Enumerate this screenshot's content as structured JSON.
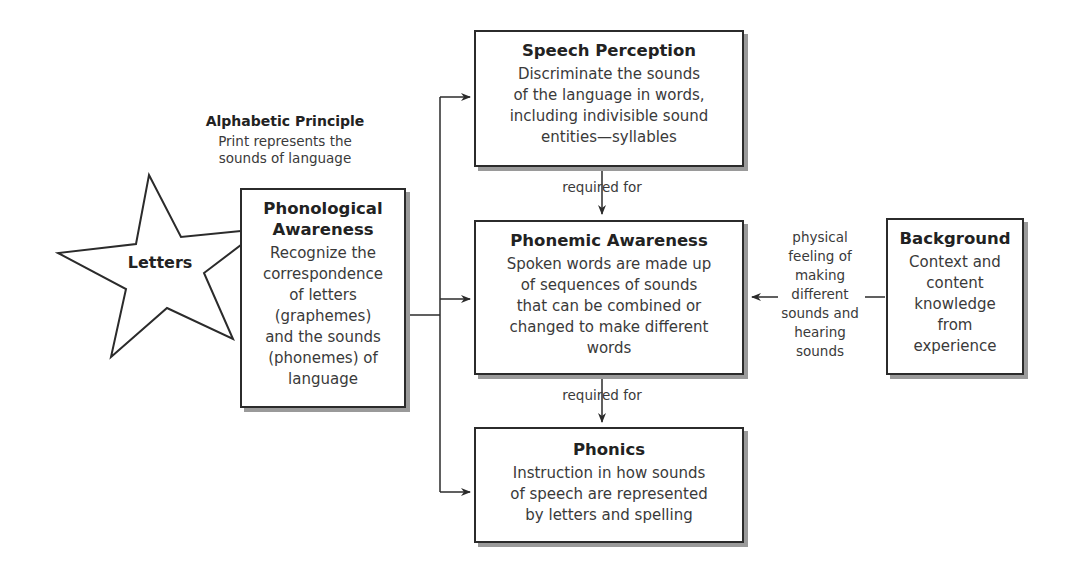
{
  "diagram": {
    "alphabetic_principle": {
      "title": "Alphabetic Principle",
      "body_lines": [
        "Print represents the",
        "sounds of language"
      ]
    },
    "star": {
      "label": "Letters"
    },
    "nodes": {
      "phonological": {
        "title_lines": [
          "Phonological",
          "Awareness"
        ],
        "body_lines": [
          "Recognize the",
          "correspondence",
          "of letters",
          "(graphemes)",
          "and the sounds",
          "(phonemes) of",
          "language"
        ]
      },
      "speech_perception": {
        "title": "Speech Perception",
        "body_lines": [
          "Discriminate the sounds",
          "of the language in words,",
          "including indivisible sound",
          "entities—syllables"
        ]
      },
      "phonemic": {
        "title": "Phonemic Awareness",
        "body_lines": [
          "Spoken words are made up",
          "of sequences of sounds",
          "that can be combined or",
          "changed to make different",
          "words"
        ]
      },
      "phonics": {
        "title": "Phonics",
        "body_lines": [
          "Instruction in how sounds",
          "of speech are represented",
          "by letters and spelling"
        ]
      },
      "background": {
        "title": "Background",
        "body_lines": [
          "Context and",
          "content",
          "knowledge",
          "from",
          "experience"
        ]
      }
    },
    "edge_labels": {
      "required_for_1": "required for",
      "required_for_2": "required for",
      "physical_feeling_lines": [
        "physical",
        "feeling of",
        "making",
        "different",
        "sounds and",
        "hearing",
        "sounds"
      ]
    },
    "colors": {
      "stroke": "#2b2b2b",
      "shadow": "#9a9a9a",
      "text": "#3a3a3a"
    }
  }
}
